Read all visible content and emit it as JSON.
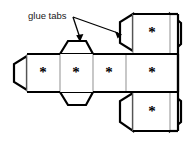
{
  "diagram": {
    "annotation": {
      "label": "glue tabs",
      "arrow_count": 2
    },
    "colors": {
      "outline": "#000000",
      "fold_line": "#9a9a9a",
      "face_fill": "#ffffff",
      "background": "#ffffff",
      "text": "#1a1a1a"
    },
    "faces": [
      {
        "id": "face-row-left-1",
        "mark": "*",
        "cx": 43,
        "cy": 73
      },
      {
        "id": "face-row-left-2",
        "mark": "*",
        "cx": 76,
        "cy": 73
      },
      {
        "id": "face-row-left-3",
        "mark": "*",
        "cx": 109,
        "cy": 73
      },
      {
        "id": "face-row-right-4",
        "mark": "*",
        "cx": 152,
        "cy": 73
      },
      {
        "id": "face-top-right",
        "mark": "*",
        "cx": 152,
        "cy": 33
      },
      {
        "id": "face-bottom-right",
        "mark": "*",
        "cx": 152,
        "cy": 112
      }
    ],
    "tabs": [
      {
        "id": "tab-left-edge",
        "side": "left"
      },
      {
        "id": "tab-upper-middle",
        "side": "top"
      },
      {
        "id": "tab-lower-middle",
        "side": "bottom"
      },
      {
        "id": "tab-top-right-left",
        "side": "left"
      },
      {
        "id": "tab-top-right-right",
        "side": "right"
      },
      {
        "id": "tab-bottom-right-left",
        "side": "left"
      },
      {
        "id": "tab-bottom-right-right",
        "side": "right"
      }
    ]
  }
}
